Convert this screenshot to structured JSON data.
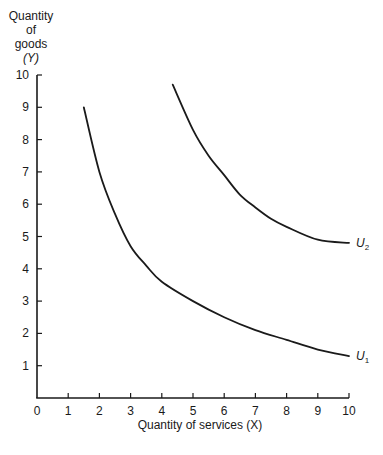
{
  "chart_data": {
    "type": "line",
    "title": "",
    "xlabel": "Quantity of services (X)",
    "ylabel": "Quantity of goods (Y)",
    "ylabel_lines": [
      "Quantity",
      "of",
      "goods",
      "(Y)"
    ],
    "xlim": [
      0,
      10
    ],
    "ylim": [
      0,
      10
    ],
    "x_ticks": [
      0,
      1,
      2,
      3,
      4,
      5,
      6,
      7,
      8,
      9,
      10
    ],
    "y_ticks": [
      1,
      2,
      3,
      4,
      5,
      6,
      7,
      8,
      9,
      10
    ],
    "grid": false,
    "legend": "none (curves labeled directly at right end)",
    "series": [
      {
        "name": "U1",
        "label_main": "U",
        "label_sub": "1",
        "x": [
          1.5,
          2,
          2.5,
          3,
          3.5,
          4,
          5,
          6,
          7,
          8,
          9,
          10
        ],
        "y": [
          9.0,
          7.0,
          5.7,
          4.7,
          4.1,
          3.6,
          3.0,
          2.5,
          2.1,
          1.8,
          1.5,
          1.3
        ]
      },
      {
        "name": "U2",
        "label_main": "U",
        "label_sub": "2",
        "x": [
          4.35,
          5,
          5.5,
          6,
          6.5,
          7,
          7.5,
          8,
          9,
          10
        ],
        "y": [
          9.7,
          8.3,
          7.5,
          6.9,
          6.3,
          5.9,
          5.55,
          5.3,
          4.9,
          4.8
        ]
      }
    ]
  }
}
